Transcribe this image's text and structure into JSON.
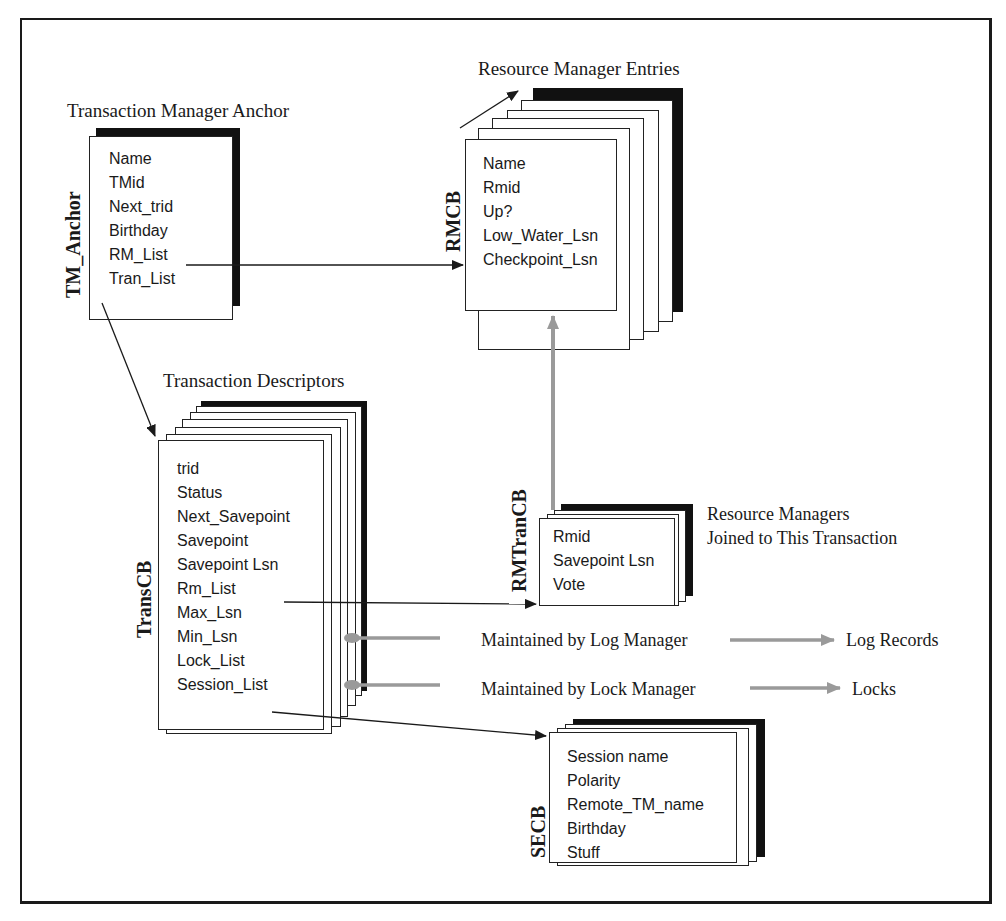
{
  "diagram": {
    "type": "data-structure-diagram",
    "structures": {
      "tm_anchor": {
        "title": "Transaction Manager  Anchor",
        "label": "TM_Anchor",
        "fields": [
          "Name",
          "TMid",
          "Next_trid",
          "Birthday",
          "RM_List",
          "Tran_List"
        ]
      },
      "rmcb": {
        "title": "Resource Manager Entries",
        "label": "RMCB",
        "fields": [
          "Name",
          "Rmid",
          "Up?",
          "Low_Water_Lsn",
          "Checkpoint_Lsn"
        ]
      },
      "transcb": {
        "title": "Transaction Descriptors",
        "label": "TransCB",
        "fields": [
          "trid",
          "Status",
          "Next_Savepoint",
          "Savepoint",
          "Savepoint Lsn",
          "Rm_List",
          "Max_Lsn",
          "Min_Lsn",
          "Lock_List",
          "Session_List"
        ]
      },
      "rmtrancb": {
        "title_lines": [
          "Resource Managers",
          "Joined to This Transaction"
        ],
        "label": "RMTranCB",
        "fields": [
          "Rmid",
          "Savepoint Lsn",
          "Vote"
        ]
      },
      "secb": {
        "label": "SECB",
        "fields": [
          "Session name",
          "Polarity",
          "Remote_TM_name",
          "Birthday",
          "Stuff"
        ]
      }
    },
    "annotations": {
      "log_manager": "Maintained by Log Manager",
      "log_records": "Log Records",
      "lock_manager": "Maintained by Lock Manager",
      "locks": "Locks"
    },
    "edges": [
      {
        "from": "TM_Anchor.RM_List",
        "to": "RMCB",
        "style": "black"
      },
      {
        "from": "TM_Anchor.Tran_List",
        "to": "TransCB",
        "style": "black"
      },
      {
        "from": "TransCB.Rm_List",
        "to": "RMTranCB",
        "style": "black"
      },
      {
        "from": "RMTranCB",
        "to": "RMCB",
        "style": "gray"
      },
      {
        "from": "TransCB.Session_List",
        "to": "SECB",
        "style": "black"
      },
      {
        "from": "TransCB.Min_Lsn",
        "to": "Log Records",
        "style": "gray",
        "via": "Maintained by Log Manager"
      },
      {
        "from": "TransCB.Lock_List",
        "to": "Locks",
        "style": "gray",
        "via": "Maintained by Lock Manager"
      }
    ],
    "colors": {
      "ink": "#1a1a1a",
      "gray_arrow": "#9a9a9a",
      "background": "#ffffff"
    }
  }
}
